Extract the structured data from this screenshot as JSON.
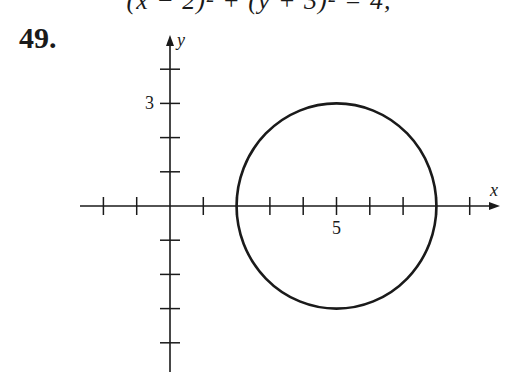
{
  "header": {
    "equation": "(x − 2)² + (y + 3)² = 4,",
    "problem_number": "49."
  },
  "chart_data": {
    "type": "scatter",
    "title": "",
    "xlabel": "x",
    "ylabel": "y",
    "x_ticks": [
      -2,
      -1,
      1,
      2,
      3,
      4,
      5,
      6,
      7,
      8,
      9
    ],
    "y_ticks": [
      -4,
      -3,
      -2,
      -1,
      1,
      2,
      3,
      4
    ],
    "x_tick_labels": [
      {
        "value": 5,
        "label": "5"
      }
    ],
    "y_tick_labels": [
      {
        "value": 3,
        "label": "3"
      }
    ],
    "xlim": [
      -2.5,
      10
    ],
    "ylim": [
      -5,
      5
    ],
    "grid": false,
    "shapes": [
      {
        "shape": "circle",
        "center": [
          5,
          0
        ],
        "radius": 3
      }
    ]
  },
  "layout": {
    "origin_px": [
      170,
      206
    ],
    "unit_px_x": 33.3,
    "unit_px_y": 34.2,
    "x_axis_px": [
      80,
      500
    ],
    "y_axis_px": [
      35,
      372
    ],
    "stroke_color": "#1a1a1a"
  }
}
